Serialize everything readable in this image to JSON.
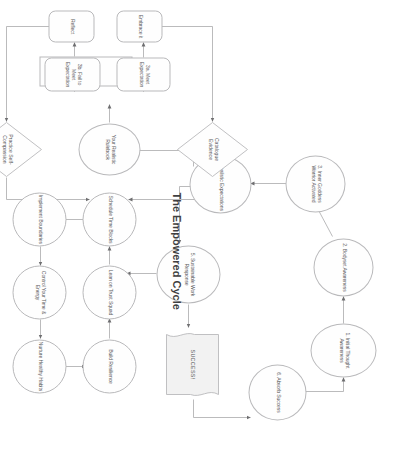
{
  "diagram": {
    "title": "The Empowered Cycle",
    "type": "flowchart",
    "orientation": "rotated-90",
    "palette": {
      "stroke": "#b9b9bb",
      "text": "#5a5a5c",
      "title": "#3f3f41",
      "background": "#ffffff",
      "document_fill": "#f2f2f2"
    },
    "nodes": [
      {
        "id": "n1",
        "label": "1. Initial Thought Awareness",
        "shape": "ellipse"
      },
      {
        "id": "n2",
        "label": "2. Bodyset Awareness",
        "shape": "ellipse"
      },
      {
        "id": "n3",
        "label": "3. Inner Goddess Warrior Activated",
        "shape": "ellipse"
      },
      {
        "id": "n4",
        "label": "4. Realistic Expectations",
        "shape": "ellipse"
      },
      {
        "id": "n5",
        "label": "5. Sustainable Work Response",
        "shape": "ellipse"
      },
      {
        "id": "n6",
        "label": "6. Absorb Success",
        "shape": "ellipse"
      },
      {
        "id": "doc",
        "label": "SUCCESS!",
        "shape": "document"
      },
      {
        "id": "r1",
        "label": "Build Resilience",
        "shape": "ellipse"
      },
      {
        "id": "r2",
        "label": "Lean on Trust Squad",
        "shape": "ellipse"
      },
      {
        "id": "r3",
        "label": "Schedule Time Blocks",
        "shape": "ellipse"
      },
      {
        "id": "r4",
        "label": "Implement Boundaries",
        "shape": "ellipse"
      },
      {
        "id": "r5",
        "label": "Control Your Time & Energy",
        "shape": "ellipse"
      },
      {
        "id": "r6",
        "label": "Nurture Healthy Habits",
        "shape": "ellipse"
      },
      {
        "id": "b0",
        "label": "Your Realistic Rulebook",
        "shape": "ellipse"
      },
      {
        "id": "b1",
        "label": "1. Thinking Style + 2. Behaviour",
        "shape": "rect"
      },
      {
        "id": "b2",
        "label": "3a. Meet Expectation",
        "shape": "rounded"
      },
      {
        "id": "b3",
        "label": "3b. Fail to Meet Expectation",
        "shape": "rounded"
      },
      {
        "id": "b4",
        "label": "Embrace it",
        "shape": "rounded"
      },
      {
        "id": "b5",
        "label": "Reflect",
        "shape": "rounded"
      },
      {
        "id": "d1",
        "label": "Catalogue Evidence",
        "shape": "diamond"
      },
      {
        "id": "d2",
        "label": "Practice Self-Compassion",
        "shape": "diamond"
      }
    ],
    "edges": [
      {
        "from": "n1",
        "to": "n2"
      },
      {
        "from": "n2",
        "to": "n3"
      },
      {
        "from": "n3",
        "to": "n4"
      },
      {
        "from": "n4",
        "to": "n5"
      },
      {
        "from": "n5",
        "to": "doc"
      },
      {
        "from": "doc",
        "to": "n6"
      },
      {
        "from": "n6",
        "to": "n1"
      },
      {
        "from": "n5",
        "to": "r3"
      },
      {
        "from": "r1",
        "to": "r2"
      },
      {
        "from": "r2",
        "to": "r3"
      },
      {
        "from": "r3",
        "to": "r4"
      },
      {
        "from": "r4",
        "to": "r5"
      },
      {
        "from": "r5",
        "to": "r6"
      },
      {
        "from": "r6",
        "to": "r1"
      },
      {
        "from": "n4",
        "to": "b0"
      },
      {
        "from": "b0",
        "to": "b1"
      },
      {
        "from": "b1",
        "to": "b2"
      },
      {
        "from": "b1",
        "to": "b3"
      },
      {
        "from": "b2",
        "to": "b4"
      },
      {
        "from": "b3",
        "to": "b5"
      },
      {
        "from": "b4",
        "to": "d1"
      },
      {
        "from": "b5",
        "to": "d2"
      },
      {
        "from": "d1",
        "to": "b0"
      },
      {
        "from": "d2",
        "to": "b0"
      }
    ]
  }
}
